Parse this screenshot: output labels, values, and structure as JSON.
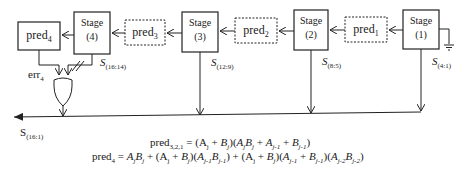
{
  "diagram": {
    "stages": [
      {
        "id": "stage4",
        "line1": "Stage",
        "line2": "(4)",
        "sum_label": "S",
        "sum_sub": "(16:14)"
      },
      {
        "id": "stage3",
        "line1": "Stage",
        "line2": "(3)",
        "sum_label": "S",
        "sum_sub": "(12:9)"
      },
      {
        "id": "stage2",
        "line1": "Stage",
        "line2": "(2)",
        "sum_label": "S",
        "sum_sub": "(8:5)"
      },
      {
        "id": "stage1",
        "line1": "Stage",
        "line2": "(1)",
        "sum_label": "S",
        "sum_sub": "(4:1)"
      }
    ],
    "predictors": [
      {
        "id": "pred4",
        "base": "pred",
        "sub": "4",
        "style": "solid"
      },
      {
        "id": "pred3",
        "base": "pred",
        "sub": "3",
        "style": "dashed"
      },
      {
        "id": "pred2",
        "base": "pred",
        "sub": "2",
        "style": "dashed"
      },
      {
        "id": "pred1",
        "base": "pred",
        "sub": "1",
        "style": "dashed"
      }
    ],
    "error_label": {
      "base": "err",
      "sub": "4"
    },
    "output_label": {
      "base": "S",
      "sub": "(16:1)"
    },
    "formulas": {
      "line1": "pred₃,₂,₁ = (Aⱼ + Bⱼ)(AⱼBⱼ + Aⱼ₋₁ + Bⱼ₋₁)",
      "line2": "pred₄ = AⱼBⱼ + (Aⱼ + Bⱼ)(Aⱼ₋₁Bⱼ₋₁) + (Aⱼ + Bⱼ)(Aⱼ₋₁ + Bⱼ₋₁)(Aⱼ₋₂Bⱼ₋₂)"
    },
    "formula_parts": {
      "l1_pred": "pred",
      "l1_sub": "3,2,1",
      "l2_pred": "pred",
      "l2_sub": "4"
    }
  }
}
